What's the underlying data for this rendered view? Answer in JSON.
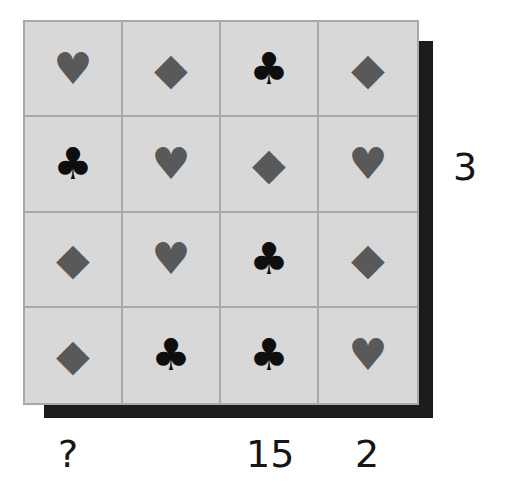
{
  "puzzle": {
    "grid": [
      [
        "heart",
        "diamond",
        "club",
        "diamond"
      ],
      [
        "club",
        "heart",
        "diamond",
        "heart"
      ],
      [
        "diamond",
        "heart",
        "club",
        "diamond"
      ],
      [
        "diamond",
        "club",
        "club",
        "heart"
      ]
    ],
    "glyphs": {
      "heart": "♥",
      "diamond": "◆",
      "club": "♣"
    },
    "row_labels": [
      "",
      "3",
      "",
      ""
    ],
    "column_labels": [
      "?",
      "",
      "15",
      "2"
    ],
    "colors": {
      "cell_bg": "#d8d8d8",
      "grid_line": "#a8a8a8",
      "red_suit": "#595959",
      "club": "#0e0e0e",
      "shadow": "#1c1c1c"
    }
  },
  "cells": [
    {
      "g": "♥",
      "t": "heart"
    },
    {
      "g": "◆",
      "t": "diamond"
    },
    {
      "g": "♣",
      "t": "club"
    },
    {
      "g": "◆",
      "t": "diamond"
    },
    {
      "g": "♣",
      "t": "club"
    },
    {
      "g": "♥",
      "t": "heart"
    },
    {
      "g": "◆",
      "t": "diamond"
    },
    {
      "g": "♥",
      "t": "heart"
    },
    {
      "g": "◆",
      "t": "diamond"
    },
    {
      "g": "♥",
      "t": "heart"
    },
    {
      "g": "♣",
      "t": "club"
    },
    {
      "g": "◆",
      "t": "diamond"
    },
    {
      "g": "◆",
      "t": "diamond"
    },
    {
      "g": "♣",
      "t": "club"
    },
    {
      "g": "♣",
      "t": "club"
    },
    {
      "g": "♥",
      "t": "heart"
    }
  ],
  "labels": {
    "row2": "3",
    "col1": "?",
    "col3": "15",
    "col4": "2"
  }
}
